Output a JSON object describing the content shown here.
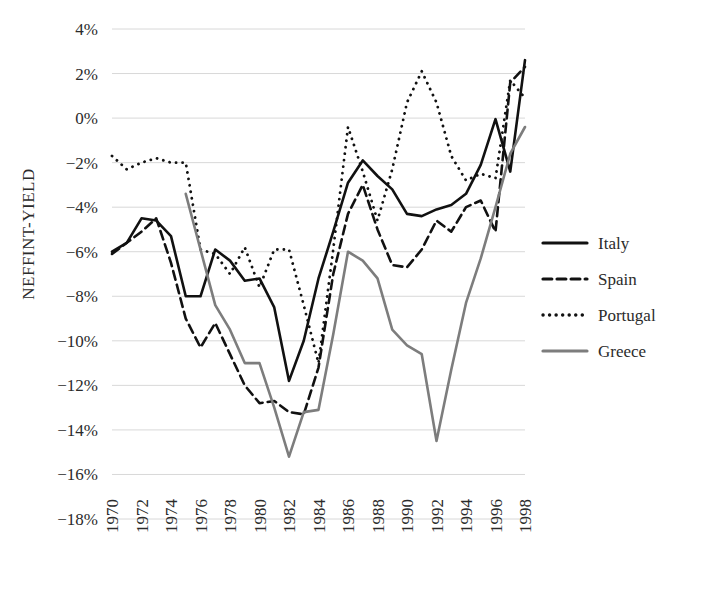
{
  "chart_data": {
    "type": "line",
    "title": "",
    "xlabel": "",
    "ylabel": "NEFFINT-YIELD",
    "ylim": [
      -18,
      4
    ],
    "xlim": [
      1970,
      1998
    ],
    "grid": true,
    "legend_position": "right",
    "y_ticks": [
      "4%",
      "2%",
      "0%",
      "−2%",
      "−4%",
      "−6%",
      "−8%",
      "−10%",
      "−12%",
      "−14%",
      "−16%",
      "−18%"
    ],
    "y_tick_values": [
      4,
      2,
      0,
      -2,
      -4,
      -6,
      -8,
      -10,
      -12,
      -14,
      -16,
      -18
    ],
    "x_ticks": [
      "1970",
      "1972",
      "1974",
      "1976",
      "1978",
      "1980",
      "1982",
      "1984",
      "1986",
      "1988",
      "1990",
      "1992",
      "1994",
      "1996",
      "1998"
    ],
    "x_tick_values": [
      1970,
      1972,
      1974,
      1976,
      1978,
      1980,
      1982,
      1984,
      1986,
      1988,
      1990,
      1992,
      1994,
      1996,
      1998
    ],
    "x": [
      1970,
      1971,
      1972,
      1973,
      1974,
      1975,
      1976,
      1977,
      1978,
      1979,
      1980,
      1981,
      1982,
      1983,
      1984,
      1985,
      1986,
      1987,
      1988,
      1989,
      1990,
      1991,
      1992,
      1993,
      1994,
      1995,
      1996,
      1997,
      1998
    ],
    "series": [
      {
        "name": "Italy",
        "style": "solid",
        "color": "#111111",
        "width": 2.6,
        "values": [
          -6.0,
          -5.6,
          -4.5,
          -4.6,
          -5.3,
          -8.0,
          -8.0,
          -5.9,
          -6.4,
          -7.3,
          -7.2,
          -8.5,
          -11.8,
          -10.0,
          -7.2,
          -5.1,
          -2.9,
          -1.9,
          -2.6,
          -3.2,
          -4.3,
          -4.4,
          -4.1,
          -3.9,
          -3.4,
          -2.1,
          -0.05,
          -2.4,
          2.6
        ]
      },
      {
        "name": "Spain",
        "style": "dashed",
        "color": "#111111",
        "width": 2.6,
        "values": [
          -6.1,
          -5.6,
          -5.1,
          -4.5,
          -6.5,
          -9.0,
          -10.3,
          -9.2,
          -10.6,
          -12.0,
          -12.8,
          -12.7,
          -13.2,
          -13.3,
          -11.2,
          -7.0,
          -4.3,
          -3.0,
          -5.0,
          -6.6,
          -6.7,
          -5.9,
          -4.6,
          -5.1,
          -4.0,
          -3.7,
          -5.1,
          1.6,
          2.3
        ]
      },
      {
        "name": "Portugal",
        "style": "dotted",
        "color": "#111111",
        "width": 2.8,
        "values": [
          -1.7,
          -2.3,
          -2.0,
          -1.8,
          -2.0,
          -2.0,
          -5.9,
          -6.1,
          -7.0,
          -5.8,
          -7.6,
          -5.9,
          -5.9,
          -8.4,
          -11.0,
          -5.9,
          -0.4,
          -2.4,
          -4.6,
          -2.3,
          0.7,
          2.1,
          0.7,
          -1.7,
          -2.8,
          -2.5,
          -2.7,
          1.7,
          0.9
        ]
      },
      {
        "name": "Greece",
        "style": "solid",
        "color": "#7d7d7d",
        "width": 2.6,
        "values": [
          null,
          null,
          null,
          null,
          null,
          -3.4,
          -5.9,
          -8.4,
          -9.5,
          -11.0,
          -11.0,
          -13.0,
          -15.2,
          -13.2,
          -13.1,
          -9.7,
          -6.0,
          -6.4,
          -7.2,
          -9.5,
          -10.2,
          -10.6,
          -14.5,
          -11.3,
          -8.3,
          -6.3,
          -4.0,
          -1.6,
          -0.4
        ]
      }
    ]
  },
  "legend": {
    "entries": [
      {
        "label": "Italy"
      },
      {
        "label": "Spain"
      },
      {
        "label": "Portugal"
      },
      {
        "label": "Greece"
      }
    ]
  }
}
